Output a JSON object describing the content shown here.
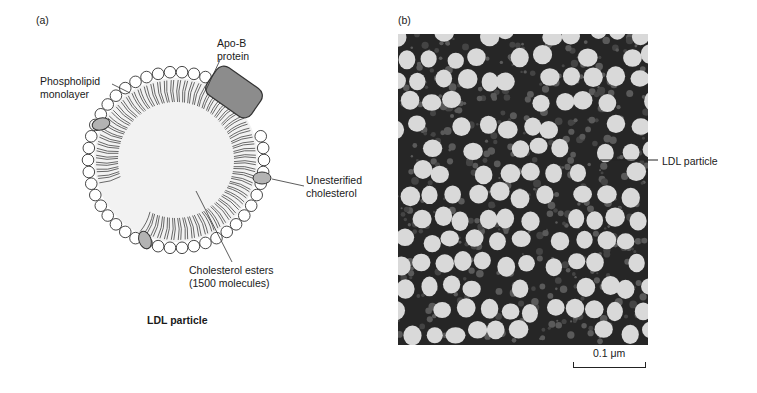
{
  "figure": {
    "panel_a": {
      "tag": "(a)",
      "title": "LDL particle",
      "labels": {
        "apo_b": "Apo-B\nprotein",
        "phospholipid": "Phospholipid\nmonolayer",
        "unesterified": "Unesterified\ncholesterol",
        "esters": "Cholesterol esters\n(1500 molecules)"
      },
      "colors": {
        "core": "#f2f2f2",
        "head": "#ffffff",
        "protein": "#8c8c8c",
        "cholesterol": "#b3b3b3",
        "outline": "#333333"
      }
    },
    "panel_b": {
      "tag": "(b)",
      "label": "LDL particle",
      "scale_bar": "0.1 μm",
      "colors": {
        "background": "#262626",
        "particle": "#d9d9d9"
      }
    }
  }
}
